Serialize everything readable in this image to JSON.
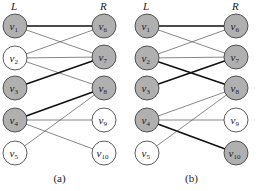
{
  "colors": {
    "matched_fill": "#b0b0b0",
    "unmatched_fill": "#ffffff",
    "stroke": "#333333",
    "thin_edge": "#555555",
    "thick_edge": "#111111"
  },
  "panels": [
    {
      "caption": "(a)",
      "left_label": "L",
      "right_label": "R",
      "offset_x": 0,
      "left_nodes": [
        {
          "id": "v1",
          "base": "v",
          "sub": "1",
          "y": 26,
          "filled": true
        },
        {
          "id": "v2",
          "base": "v",
          "sub": "2",
          "y": 58,
          "filled": false
        },
        {
          "id": "v3",
          "base": "v",
          "sub": "3",
          "y": 88,
          "filled": true
        },
        {
          "id": "v4",
          "base": "v",
          "sub": "4",
          "y": 120,
          "filled": true
        },
        {
          "id": "v5",
          "base": "v",
          "sub": "5",
          "y": 153,
          "filled": false
        }
      ],
      "right_nodes": [
        {
          "id": "v6",
          "base": "v",
          "sub": "6",
          "y": 26,
          "filled": true
        },
        {
          "id": "v7",
          "base": "v",
          "sub": "7",
          "y": 57,
          "filled": true
        },
        {
          "id": "v8",
          "base": "v",
          "sub": "8",
          "y": 88,
          "filled": true
        },
        {
          "id": "v9",
          "base": "v",
          "sub": "9",
          "y": 120,
          "filled": false
        },
        {
          "id": "v10",
          "base": "v",
          "sub": "10",
          "y": 153,
          "filled": false
        }
      ],
      "edges": [
        {
          "from": "v1",
          "to": "v6",
          "thick": true
        },
        {
          "from": "v1",
          "to": "v7",
          "thick": false
        },
        {
          "from": "v2",
          "to": "v6",
          "thick": false
        },
        {
          "from": "v2",
          "to": "v7",
          "thick": false
        },
        {
          "from": "v2",
          "to": "v8",
          "thick": false
        },
        {
          "from": "v3",
          "to": "v7",
          "thick": true
        },
        {
          "from": "v4",
          "to": "v8",
          "thick": true
        },
        {
          "from": "v4",
          "to": "v9",
          "thick": false
        },
        {
          "from": "v4",
          "to": "v10",
          "thick": false
        },
        {
          "from": "v5",
          "to": "v8",
          "thick": false
        }
      ]
    },
    {
      "caption": "(b)",
      "left_label": "L",
      "right_label": "R",
      "offset_x": 132,
      "left_nodes": [
        {
          "id": "v1",
          "base": "v",
          "sub": "1",
          "y": 26,
          "filled": true
        },
        {
          "id": "v2",
          "base": "v",
          "sub": "2",
          "y": 58,
          "filled": true
        },
        {
          "id": "v3",
          "base": "v",
          "sub": "3",
          "y": 88,
          "filled": true
        },
        {
          "id": "v4",
          "base": "v",
          "sub": "4",
          "y": 120,
          "filled": true
        },
        {
          "id": "v5",
          "base": "v",
          "sub": "5",
          "y": 153,
          "filled": false
        }
      ],
      "right_nodes": [
        {
          "id": "v6",
          "base": "v",
          "sub": "6",
          "y": 26,
          "filled": true
        },
        {
          "id": "v7",
          "base": "v",
          "sub": "7",
          "y": 57,
          "filled": true
        },
        {
          "id": "v8",
          "base": "v",
          "sub": "8",
          "y": 88,
          "filled": true
        },
        {
          "id": "v9",
          "base": "v",
          "sub": "9",
          "y": 120,
          "filled": false
        },
        {
          "id": "v10",
          "base": "v",
          "sub": "10",
          "y": 153,
          "filled": true
        }
      ],
      "edges": [
        {
          "from": "v1",
          "to": "v6",
          "thick": true
        },
        {
          "from": "v1",
          "to": "v7",
          "thick": false
        },
        {
          "from": "v2",
          "to": "v6",
          "thick": false
        },
        {
          "from": "v2",
          "to": "v7",
          "thick": false
        },
        {
          "from": "v2",
          "to": "v8",
          "thick": true
        },
        {
          "from": "v3",
          "to": "v7",
          "thick": true
        },
        {
          "from": "v4",
          "to": "v8",
          "thick": false
        },
        {
          "from": "v4",
          "to": "v9",
          "thick": false
        },
        {
          "from": "v4",
          "to": "v10",
          "thick": true
        },
        {
          "from": "v5",
          "to": "v8",
          "thick": false
        }
      ]
    }
  ]
}
